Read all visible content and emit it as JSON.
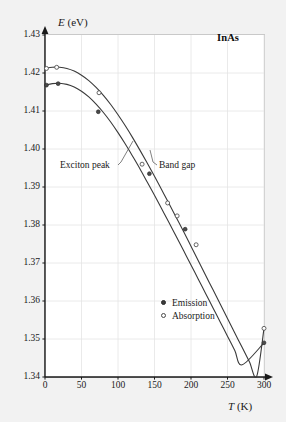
{
  "figure": {
    "sample_label": "InAs",
    "background_color": "#f2f2f2",
    "plot_background_color": "#ffffff",
    "grid_color": "#e4e4e4",
    "axis_color": "#1a1a1a",
    "curve_color": "#3a3a3a"
  },
  "axes": {
    "y_axis_label_symbol": "E",
    "y_axis_label_unit": " (eV)",
    "x_axis_label_symbol": "T",
    "x_axis_label_unit": " (K)",
    "y_ticks": [
      "1.43",
      "1.42",
      "1.41",
      "1.40",
      "1.39",
      "1.38",
      "1.37",
      "1.36",
      "1.35",
      "1.34"
    ],
    "x_ticks": [
      "0",
      "50",
      "100",
      "150",
      "200",
      "250",
      "300"
    ]
  },
  "annotations": {
    "exciton_peak": "Exciton peak",
    "band_gap": "Band gap"
  },
  "legend": {
    "items": [
      {
        "marker": "filled-circle-icon",
        "label": "Emission"
      },
      {
        "marker": "open-circle-icon",
        "label": "Absorption"
      }
    ]
  },
  "chart_data": {
    "type": "line",
    "title": "",
    "subtitle": "",
    "material": "InAs",
    "xlabel": "T (K)",
    "ylabel": "E (eV)",
    "xlim": [
      0,
      300
    ],
    "ylim": [
      1.34,
      1.43
    ],
    "x_tick_step": 50,
    "y_tick_step": 0.01,
    "grid": true,
    "legend_position": "inner-lower-right",
    "annotations": [
      {
        "text": "Exciton peak",
        "points_to_curve": "Exciton peak",
        "x": 112,
        "y": 1.3975
      },
      {
        "text": "Band gap",
        "points_to_curve": "Band gap",
        "x": 152,
        "y": 1.3975
      }
    ],
    "series": [
      {
        "name": "Band gap",
        "marker": "open-circle",
        "curve_x": [
          0,
          10,
          20,
          30,
          40,
          50,
          60,
          70,
          80,
          90,
          100,
          110,
          120,
          130,
          140,
          150,
          160,
          170,
          180,
          190,
          200,
          210,
          220,
          230,
          240,
          250,
          260,
          270,
          280,
          290,
          300
        ],
        "curve_y": [
          1.4212,
          1.4215,
          1.4215,
          1.4212,
          1.4205,
          1.4194,
          1.418,
          1.4162,
          1.4141,
          1.4117,
          1.409,
          1.4061,
          1.403,
          1.3997,
          1.3963,
          1.3928,
          1.3892,
          1.3856,
          1.3819,
          1.3782,
          1.3744,
          1.3706,
          1.3668,
          1.363,
          1.3592,
          1.3554,
          1.3516,
          1.3478,
          1.344,
          1.3402,
          1.3528
        ],
        "data_points": [
          {
            "x": 2,
            "y": 1.4212
          },
          {
            "x": 16,
            "y": 1.4215
          },
          {
            "x": 74,
            "y": 1.4148
          },
          {
            "x": 133,
            "y": 1.396
          },
          {
            "x": 168,
            "y": 1.3858
          },
          {
            "x": 181,
            "y": 1.3824
          },
          {
            "x": 207,
            "y": 1.3748
          },
          {
            "x": 300,
            "y": 1.3528
          }
        ]
      },
      {
        "name": "Exciton peak",
        "marker": "filled-circle",
        "curve_x": [
          0,
          10,
          20,
          30,
          40,
          50,
          60,
          70,
          80,
          90,
          100,
          110,
          120,
          130,
          140,
          150,
          160,
          170,
          180,
          190,
          200,
          210,
          220,
          230,
          240,
          250,
          260,
          270,
          280,
          290,
          300
        ],
        "curve_y": [
          1.4168,
          1.4172,
          1.4173,
          1.417,
          1.4163,
          1.4152,
          1.4137,
          1.4118,
          1.4096,
          1.4071,
          1.4043,
          1.4013,
          1.3981,
          1.3948,
          1.3913,
          1.3878,
          1.3842,
          1.3806,
          1.3769,
          1.3732,
          1.3695,
          1.3657,
          1.362,
          1.3582,
          1.3545,
          1.3507,
          1.347,
          1.3432,
          1.3395,
          1.3357,
          1.349
        ],
        "data_points": [
          {
            "x": 2,
            "y": 1.4168
          },
          {
            "x": 18,
            "y": 1.4172
          },
          {
            "x": 73,
            "y": 1.4098
          },
          {
            "x": 143,
            "y": 1.3935
          },
          {
            "x": 192,
            "y": 1.3789
          },
          {
            "x": 300,
            "y": 1.349
          }
        ]
      }
    ]
  }
}
